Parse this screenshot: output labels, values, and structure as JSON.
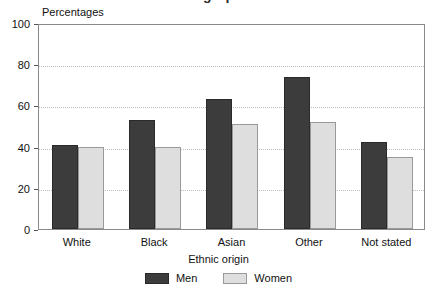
{
  "chart_data": {
    "type": "bar",
    "title": "",
    "title_clipped": "…g…p…",
    "categories": [
      "White",
      "Black",
      "Asian",
      "Other",
      "Not stated"
    ],
    "series": [
      {
        "name": "Men",
        "values": [
          41,
          53,
          63,
          74,
          42
        ],
        "color": "#3c3c3c"
      },
      {
        "name": "Women",
        "values": [
          40,
          40,
          51,
          52,
          35
        ],
        "color": "#dedede"
      }
    ],
    "xlabel": "Ethnic origin",
    "ylabel": "Percentages",
    "ylim": [
      0,
      100
    ],
    "yticks": [
      0,
      20,
      40,
      60,
      80,
      100
    ],
    "ytick_labels": [
      "0",
      "20",
      "40",
      "60",
      "80",
      "100"
    ],
    "grid": true,
    "grid_style": "dotted",
    "grid_color": "#bdbdbd",
    "legend_position": "bottom-center",
    "axis_color": "#8a8a8a"
  }
}
